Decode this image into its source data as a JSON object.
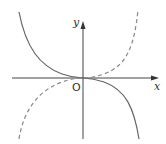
{
  "diagram": {
    "type": "function-graph",
    "axes": {
      "x_label": "x",
      "y_label": "y",
      "origin_label": "O"
    },
    "curves": [
      {
        "name": "solid-curve",
        "style": "solid",
        "shape": "decreasing cubic through origin",
        "color": "#666666"
      },
      {
        "name": "dashed-curve",
        "style": "dashed",
        "shape": "increasing cubic through origin",
        "color": "#888888"
      }
    ],
    "colors": {
      "axis": "#444444",
      "solid": "#666666",
      "dashed": "#888888"
    }
  }
}
